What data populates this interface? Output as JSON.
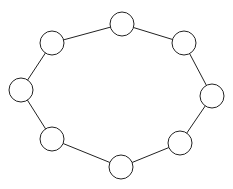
{
  "diagram": {
    "type": "ring-graph",
    "colors": {
      "stroke": "#222222",
      "fill": "#ffffff",
      "background": "#ffffff"
    },
    "node_radius": 12,
    "nodes": [
      {
        "id": "n1",
        "x": 122,
        "y": 24
      },
      {
        "id": "n2",
        "x": 184,
        "y": 43
      },
      {
        "id": "n3",
        "x": 212,
        "y": 96
      },
      {
        "id": "n4",
        "x": 180,
        "y": 143
      },
      {
        "id": "n5",
        "x": 121,
        "y": 167
      },
      {
        "id": "n6",
        "x": 52,
        "y": 139
      },
      {
        "id": "n7",
        "x": 21,
        "y": 90
      },
      {
        "id": "n8",
        "x": 52,
        "y": 43
      }
    ],
    "edges": [
      [
        "n1",
        "n2"
      ],
      [
        "n2",
        "n3"
      ],
      [
        "n3",
        "n4"
      ],
      [
        "n4",
        "n5"
      ],
      [
        "n5",
        "n6"
      ],
      [
        "n6",
        "n7"
      ],
      [
        "n7",
        "n8"
      ],
      [
        "n8",
        "n1"
      ]
    ]
  }
}
